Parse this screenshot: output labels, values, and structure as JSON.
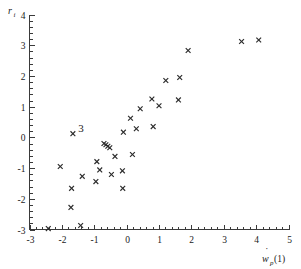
{
  "figure": {
    "background_color": "#ffffff",
    "marker_color": "#2b2b2b",
    "axis_color": "#3a3a3a",
    "marker_symbol": "x",
    "annotation": {
      "text": "3",
      "x": -1.62,
      "y": 0.22
    }
  },
  "chart_data": {
    "type": "scatter",
    "title": "",
    "xlabel": "ẇ_p(1)",
    "ylabel": "r_i",
    "xlabel_parts": {
      "base": "w",
      "dot": "˙",
      "subscript": "p",
      "suffix": "(1)"
    },
    "ylabel_parts": {
      "base": "r",
      "subscript": "i"
    },
    "xlim": [
      -3,
      5
    ],
    "ylim": [
      -3,
      4
    ],
    "xticks": [
      -3,
      -2,
      -1,
      0,
      1,
      2,
      3,
      4,
      5
    ],
    "xticklabels": [
      "-3",
      "-2",
      "-1",
      "0",
      "1",
      "2",
      "3",
      "4",
      "5"
    ],
    "yticks": [
      -3,
      -2,
      -1,
      0,
      1,
      2,
      3,
      4
    ],
    "yticklabels": [
      "-3",
      "-2",
      "-1",
      "0",
      "1",
      "2",
      "3",
      "4"
    ],
    "x_minor_per_major": 5,
    "y_minor_per_major": 5,
    "grid": false,
    "legend": null,
    "points": [
      {
        "x": -2.42,
        "y": -2.97
      },
      {
        "x": -2.05,
        "y": -0.95
      },
      {
        "x": -1.72,
        "y": -2.28
      },
      {
        "x": -1.7,
        "y": -1.66
      },
      {
        "x": -1.66,
        "y": 0.12
      },
      {
        "x": -1.42,
        "y": -2.87
      },
      {
        "x": -1.37,
        "y": -1.27
      },
      {
        "x": -0.95,
        "y": -1.44
      },
      {
        "x": -0.92,
        "y": -0.79
      },
      {
        "x": -0.83,
        "y": -1.06
      },
      {
        "x": -0.7,
        "y": -0.2
      },
      {
        "x": -0.64,
        "y": -0.24
      },
      {
        "x": -0.58,
        "y": -0.29
      },
      {
        "x": -0.52,
        "y": -0.34
      },
      {
        "x": -0.47,
        "y": -1.21
      },
      {
        "x": -0.36,
        "y": -0.62
      },
      {
        "x": -0.13,
        "y": -1.09
      },
      {
        "x": -0.12,
        "y": -1.66
      },
      {
        "x": -0.1,
        "y": 0.17
      },
      {
        "x": 0.12,
        "y": 0.62
      },
      {
        "x": 0.18,
        "y": -0.56
      },
      {
        "x": 0.3,
        "y": 0.28
      },
      {
        "x": 0.42,
        "y": 0.93
      },
      {
        "x": 0.78,
        "y": 1.25
      },
      {
        "x": 0.82,
        "y": 0.35
      },
      {
        "x": 1.0,
        "y": 1.03
      },
      {
        "x": 1.21,
        "y": 1.85
      },
      {
        "x": 1.6,
        "y": 1.22
      },
      {
        "x": 1.64,
        "y": 1.95
      },
      {
        "x": 1.9,
        "y": 2.83
      },
      {
        "x": 3.55,
        "y": 3.12
      },
      {
        "x": 4.08,
        "y": 3.17
      }
    ]
  }
}
